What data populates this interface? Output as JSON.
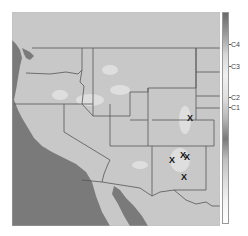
{
  "map": {
    "region": "Western United States",
    "colors": {
      "land": "#c8c8c8",
      "land_highlight": "#e6e6e6",
      "ocean": "#7a7a7a",
      "border": "#555555",
      "marker": "#111111"
    },
    "markers": [
      {
        "label": "X",
        "x": 190,
        "y": 118
      },
      {
        "label": "X",
        "x": 172,
        "y": 160
      },
      {
        "label": "X",
        "x": 183,
        "y": 155
      },
      {
        "label": "X",
        "x": 187,
        "y": 157
      },
      {
        "label": "X",
        "x": 184,
        "y": 177
      }
    ]
  },
  "colorbar": {
    "gradient": [
      "#6a6a6a",
      "#9a9a9a",
      "#d8d8d8",
      "#f0f0f0",
      "#e0e0e0",
      "#b8b8b8",
      "#7a7a7a",
      "#c0c0c0",
      "#dcdcdc",
      "#f4f4f4",
      "#ffffff"
    ],
    "labels": [
      {
        "text": "C4",
        "y": 44
      },
      {
        "text": "C3",
        "y": 66
      },
      {
        "text": "C2",
        "y": 97
      },
      {
        "text": "C1",
        "y": 107
      }
    ]
  }
}
